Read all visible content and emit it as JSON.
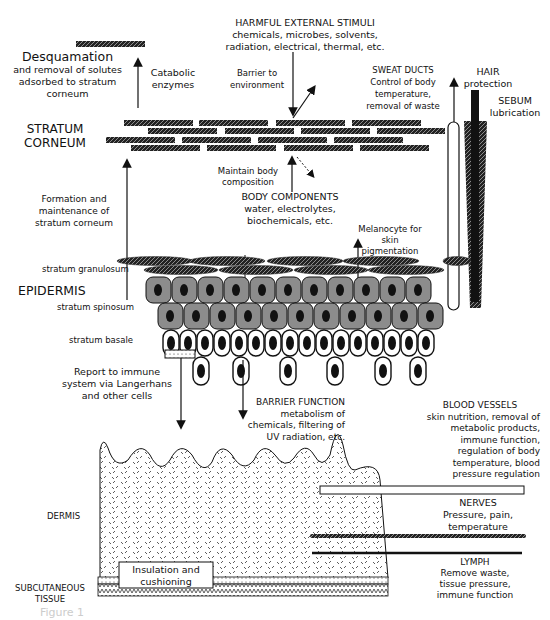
{
  "labels": {
    "harmful": {
      "title": "HARMFUL EXTERNAL STIMULI",
      "line1": "chemicals, microbes, solvents,",
      "line2": "radiation, electrical, thermal, etc."
    },
    "desquamation": {
      "title": "Desquamation",
      "line1": "and removal of solutes",
      "line2": "adsorbed to stratum",
      "line3": "corneum"
    },
    "catabolic": {
      "line1": "Catabolic",
      "line2": "enzymes"
    },
    "barrier_env": {
      "line1": "Barrier to",
      "line2": "environment"
    },
    "sweat": {
      "title": "SWEAT DUCTS",
      "line1": "Control of body",
      "line2": "temperature,",
      "line3": "removal of waste"
    },
    "hair": {
      "title": "HAIR",
      "line1": "protection"
    },
    "sebum": {
      "title": "SEBUM",
      "line1": "lubrication"
    },
    "stratum_corneum": {
      "line1": "STRATUM",
      "line2": "CORNEUM"
    },
    "maintain": {
      "line1": "Maintain body",
      "line2": "composition"
    },
    "body_components": {
      "title": "BODY COMPONENTS",
      "line1": "water, electrolytes,",
      "line2": "biochemicals, etc."
    },
    "formation": {
      "line1": "Formation and",
      "line2": "maintenance of",
      "line3": "stratum corneum"
    },
    "melanocyte": {
      "line1": "Melanocyte for",
      "line2": "skin",
      "line3": "pigmentation"
    },
    "stratum_granulosum": "stratum granulosum",
    "epidermis": "EPIDERMIS",
    "stratum_spinosum": "stratum spinosum",
    "stratum_basale": "stratum basale",
    "immune_report": {
      "line1": "Report to immune",
      "line2": "system via Langerhans",
      "line3": "and other cells"
    },
    "barrier_function": {
      "title": "BARRIER FUNCTION",
      "line1": "metabolism of",
      "line2": "chemicals, filtering of",
      "line3": "UV radiation, etc."
    },
    "blood_vessels": {
      "title": "BLOOD VESSELS",
      "line1": "skin nutrition, removal of",
      "line2": "metabolic products,",
      "line3": "immune function,",
      "line4": "regulation of body",
      "line5": "temperature, blood",
      "line6": "pressure regulation"
    },
    "nerves": {
      "title": "NERVES",
      "line1": "Pressure, pain,",
      "line2": "temperature"
    },
    "lymph": {
      "title": "LYMPH",
      "line1": "Remove waste,",
      "line2": "tissue pressure,",
      "line3": "immune function"
    },
    "dermis": "DERMIS",
    "insulation": {
      "line1": "Insulation and",
      "line2": "cushioning"
    },
    "subcutaneous": {
      "line1": "SUBCUTANEOUS",
      "line2": "TISSUE"
    },
    "caption": "Figure 1"
  },
  "colors": {
    "ink": "#111111",
    "cell_fill": "#8c8c8c",
    "background": "#ffffff"
  }
}
